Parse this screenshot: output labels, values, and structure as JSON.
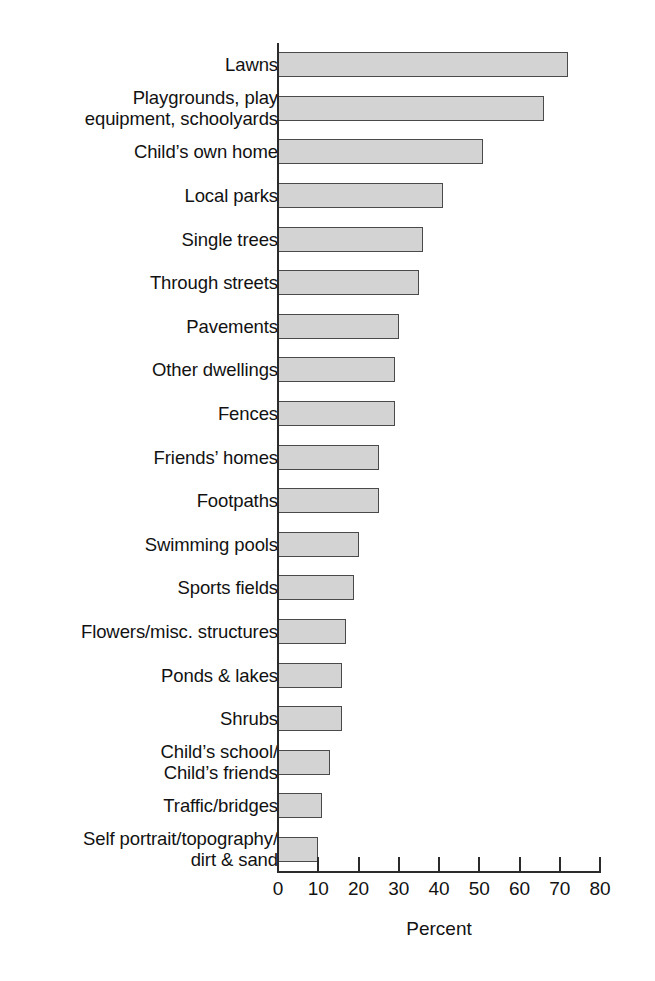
{
  "chart_data": {
    "type": "bar",
    "orientation": "horizontal",
    "title": "",
    "xlabel": "Percent",
    "ylabel": "",
    "xlim": [
      0,
      80
    ],
    "xticks": [
      0,
      10,
      20,
      30,
      40,
      50,
      60,
      70,
      80
    ],
    "grid": false,
    "legend": false,
    "bar_fill_color": "#d3d3d3",
    "bar_edge_color": "#4a4a4a",
    "axis_color": "#2b2b2b",
    "categories": [
      "Lawns",
      "Playgrounds, play\nequipment, schoolyards",
      "Child’s own home",
      "Local parks",
      "Single trees",
      "Through streets",
      "Pavements",
      "Other dwellings",
      "Fences",
      "Friends’ homes",
      "Footpaths",
      "Swimming pools",
      "Sports fields",
      "Flowers/misc. structures",
      "Ponds & lakes",
      "Shrubs",
      "Child’s school/\nChild’s friends",
      "Traffic/bridges",
      "Self portrait/topography/\ndirt & sand"
    ],
    "values": [
      72,
      66,
      51,
      41,
      36,
      35,
      30,
      29,
      29,
      25,
      25,
      20,
      19,
      17,
      16,
      16,
      13,
      11,
      10
    ]
  }
}
